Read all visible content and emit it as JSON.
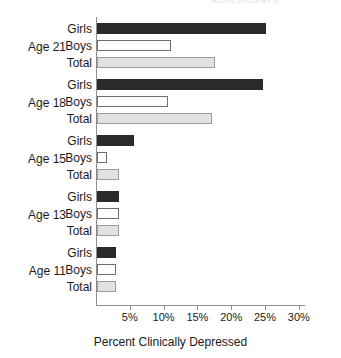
{
  "clipped_title": "ADOLESCENTS",
  "chart_data": {
    "type": "bar",
    "orientation": "horizontal",
    "title": "",
    "xlabel": "Percent Clinically Depressed",
    "ylabel": "",
    "xlim": [
      0,
      31
    ],
    "grid": false,
    "legend": "none",
    "tick_labels": [
      "5%",
      "10%",
      "15%",
      "20%",
      "25%",
      "30%"
    ],
    "tick_values": [
      5,
      10,
      15,
      20,
      25,
      30
    ],
    "categories": [
      "Age 21",
      "Age 18",
      "Age 15",
      "Age 13",
      "Age 11"
    ],
    "series": [
      {
        "name": "Girls",
        "values": [
          25.0,
          24.5,
          5.5,
          3.2,
          2.8
        ]
      },
      {
        "name": "Boys",
        "values": [
          11.0,
          10.5,
          1.5,
          3.2,
          2.8
        ]
      },
      {
        "name": "Total",
        "values": [
          17.5,
          17.0,
          3.2,
          3.2,
          2.8
        ]
      }
    ],
    "groups": [
      {
        "label": "Age 21",
        "bars": [
          {
            "label": "Girls",
            "value": 25.0,
            "style": "girls"
          },
          {
            "label": "Boys",
            "value": 11.0,
            "style": "boys"
          },
          {
            "label": "Total",
            "value": 17.5,
            "style": "total"
          }
        ]
      },
      {
        "label": "Age 18",
        "bars": [
          {
            "label": "Girls",
            "value": 24.5,
            "style": "girls"
          },
          {
            "label": "Boys",
            "value": 10.5,
            "style": "boys"
          },
          {
            "label": "Total",
            "value": 17.0,
            "style": "total"
          }
        ]
      },
      {
        "label": "Age 15",
        "bars": [
          {
            "label": "Girls",
            "value": 5.5,
            "style": "girls"
          },
          {
            "label": "Boys",
            "value": 1.5,
            "style": "boys"
          },
          {
            "label": "Total",
            "value": 3.2,
            "style": "total"
          }
        ]
      },
      {
        "label": "Age 13",
        "bars": [
          {
            "label": "Girls",
            "value": 3.2,
            "style": "girls"
          },
          {
            "label": "Boys",
            "value": 3.2,
            "style": "boys"
          },
          {
            "label": "Total",
            "value": 3.2,
            "style": "total"
          }
        ]
      },
      {
        "label": "Age 11",
        "bars": [
          {
            "label": "Girls",
            "value": 2.8,
            "style": "girls"
          },
          {
            "label": "Boys",
            "value": 2.8,
            "style": "boys"
          },
          {
            "label": "Total",
            "value": 2.8,
            "style": "total"
          }
        ]
      }
    ],
    "colors": {
      "girls_fill": "#2b2b2b",
      "boys_fill": "#ffffff",
      "boys_stroke": "#6e6e6e",
      "total_fill": "#e2e2e2",
      "total_stroke": "#9a9a9a",
      "axis": "#8d8d8d",
      "text": "#1a1a1a",
      "background": "#ffffff"
    }
  }
}
